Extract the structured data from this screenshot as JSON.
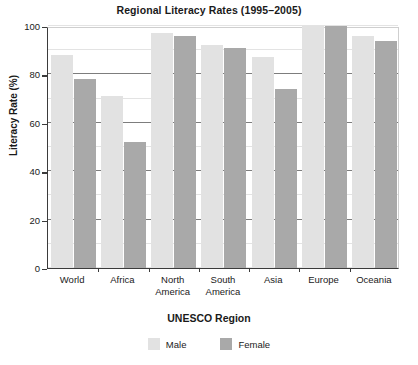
{
  "chart_data": {
    "type": "bar",
    "title": "Regional Literacy Rates (1995–2005)",
    "xlabel": "UNESCO Region",
    "ylabel": "Literacy Rate (%)",
    "categories": [
      "World",
      "Africa",
      "North America",
      "South America",
      "Asia",
      "Europe",
      "Oceania"
    ],
    "series": [
      {
        "name": "Male",
        "color": "#e2e2e2",
        "values": [
          88,
          71,
          97,
          92,
          87,
          100,
          96
        ]
      },
      {
        "name": "Female",
        "color": "#a9a9a9",
        "values": [
          78,
          52,
          96,
          91,
          74,
          100,
          94
        ]
      }
    ],
    "ylim": [
      0,
      100
    ],
    "yticks": [
      0,
      20,
      40,
      60,
      80,
      100
    ],
    "ytick_labels": [
      "0",
      "20",
      "40",
      "60",
      "80",
      "100"
    ],
    "minor_gridline_step": 10,
    "grid": true,
    "legend_position": "bottom",
    "legend_entries": [
      "Male",
      "Female"
    ]
  }
}
